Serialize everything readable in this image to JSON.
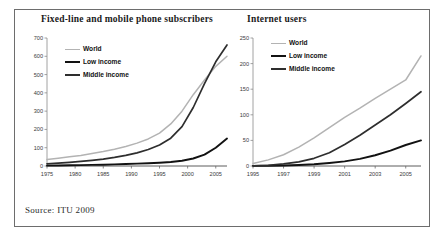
{
  "figure": {
    "source_label": "Source: ITU 2009",
    "border_color": "#6d6d6d"
  },
  "series_colors": {
    "world": "#b3b3b3",
    "low_income": "#121212",
    "middle_income": "#2e2e2e"
  },
  "legend": {
    "world": "World",
    "low_income": "Low income",
    "middle_income": "Middle income"
  },
  "chart_data": [
    {
      "type": "line",
      "title": "Fixed-line and mobile phone subscribers",
      "xlabel": "",
      "ylabel": "",
      "xlim": [
        1975,
        2007
      ],
      "ylim": [
        0,
        700
      ],
      "grid": false,
      "legend_position": "top-left",
      "xticks": [
        1975,
        1980,
        1985,
        1990,
        1995,
        2000,
        2005
      ],
      "yticks": [
        0,
        100,
        200,
        300,
        400,
        500,
        600,
        700
      ],
      "x": [
        1975,
        1977,
        1979,
        1981,
        1983,
        1985,
        1987,
        1989,
        1991,
        1993,
        1995,
        1997,
        1999,
        2001,
        2003,
        2005,
        2007
      ],
      "series": [
        {
          "name": "World",
          "color": "#b3b3b3",
          "values": [
            35,
            42,
            50,
            58,
            68,
            79,
            92,
            107,
            125,
            148,
            180,
            230,
            300,
            390,
            470,
            545,
            600
          ]
        },
        {
          "name": "Low income",
          "color": "#121212",
          "values": [
            2,
            3,
            4,
            5,
            6,
            7,
            9,
            11,
            13,
            15,
            18,
            22,
            29,
            41,
            62,
            100,
            150
          ]
        },
        {
          "name": "Middle income",
          "color": "#2e2e2e",
          "values": [
            12,
            16,
            20,
            25,
            31,
            38,
            47,
            58,
            72,
            90,
            115,
            152,
            215,
            320,
            450,
            570,
            662
          ]
        }
      ]
    },
    {
      "type": "line",
      "title": "Internet users",
      "xlabel": "",
      "ylabel": "",
      "xlim": [
        1995,
        2006
      ],
      "ylim": [
        0,
        250
      ],
      "grid": false,
      "legend_position": "top-left",
      "xticks": [
        1995,
        1997,
        1999,
        2001,
        2003,
        2005
      ],
      "yticks": [
        0,
        50,
        100,
        150,
        200,
        250
      ],
      "x": [
        1995,
        1996,
        1997,
        1998,
        1999,
        2000,
        2001,
        2002,
        2003,
        2004,
        2005,
        2006
      ],
      "series": [
        {
          "name": "World",
          "color": "#b3b3b3",
          "values": [
            5,
            12,
            22,
            37,
            55,
            75,
            95,
            113,
            132,
            150,
            168,
            215
          ]
        },
        {
          "name": "Low income",
          "color": "#121212",
          "values": [
            0.3,
            0.6,
            1,
            2,
            3.5,
            6,
            9,
            14,
            21,
            30,
            41,
            50
          ]
        },
        {
          "name": "Middle income",
          "color": "#2e2e2e",
          "values": [
            0.5,
            1.5,
            4,
            8,
            15,
            26,
            42,
            60,
            80,
            100,
            122,
            145
          ]
        }
      ]
    }
  ]
}
